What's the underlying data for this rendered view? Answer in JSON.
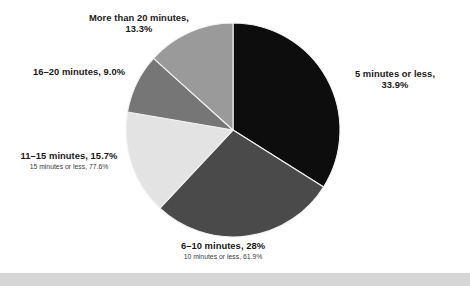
{
  "chart_data": {
    "type": "pie",
    "title": "",
    "subtitle": "",
    "xlabel": "",
    "ylabel": "",
    "legend_position": "none",
    "grid": false,
    "start_angle_deg": 0,
    "direction": "clockwise",
    "categories": [
      "5 minutes or less",
      "6–10 minutes",
      "11–15 minutes",
      "16–20 minutes",
      "More than 20 minutes"
    ],
    "values": [
      33.9,
      28.0,
      15.7,
      9.0,
      13.3
    ],
    "value_labels": [
      "33.9%",
      "28%",
      "15.7%",
      "9.0%",
      "13.3%"
    ],
    "colors": [
      "#0d0d0d",
      "#4a4a4a",
      "#e3e3e3",
      "#767676",
      "#9a9a9a"
    ],
    "cumulative_annotations": [
      {
        "after_category": "6–10 minutes",
        "text": "10 minutes or less, 61.9%",
        "value": 61.9
      },
      {
        "after_category": "11–15 minutes",
        "text": "15 minutes or less, 77.6%",
        "value": 77.6
      }
    ]
  },
  "labels": {
    "more_than_20": {
      "line1": "More than 20 minutes,",
      "line2": "13.3%"
    },
    "sixteen_to_twenty": {
      "line1": "16–20 minutes, 9.0%"
    },
    "eleven_to_fifteen": {
      "line1": "11–15 minutes, 15.7%",
      "sub": "15 minutes or less, 77.6%"
    },
    "six_to_ten": {
      "line1": "6–10 minutes, 28%",
      "sub": "10 minutes or less, 61.9%"
    },
    "five_or_less": {
      "line1": "5 minutes or less,",
      "line2": "33.9%"
    }
  },
  "geometry": {
    "center_x": 233,
    "center_y": 130,
    "radius": 107
  },
  "theme": {
    "background": "#ffffff",
    "text_color": "#1a1a1a",
    "separator_color": "#f2f2f2",
    "footer_band_color": "#d6d6d6"
  }
}
